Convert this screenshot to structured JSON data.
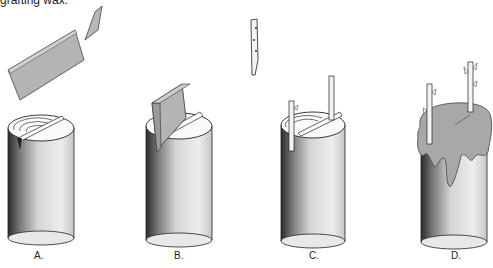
{
  "caption": {
    "text": "grafting wax."
  },
  "panels": [
    {
      "id": "A",
      "label": "A.",
      "description": "Stock cylinder top with cleft knife held above"
    },
    {
      "id": "B",
      "label": "B.",
      "description": "Knife wedge driven into cleft of stock"
    },
    {
      "id": "C",
      "label": "C.",
      "description": "Scion inserted into cleft; second scion shown above"
    },
    {
      "id": "D",
      "label": "D.",
      "description": "Graft union sealed with grafting wax"
    }
  ],
  "colors": {
    "blade_gray": "#b4b4b4",
    "blade_edge": "#555555",
    "wax_gray": "#a8a8a8",
    "stipple_dark": "#1a1a1a",
    "background": "#ffffff"
  }
}
